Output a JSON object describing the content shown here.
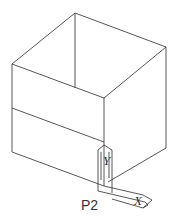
{
  "diagram": {
    "type": "isometric wireframe box with UCS icon",
    "point_label": "P2",
    "axis_x_label": "X",
    "axis_y_label": "Y",
    "line_color": "#444444"
  }
}
